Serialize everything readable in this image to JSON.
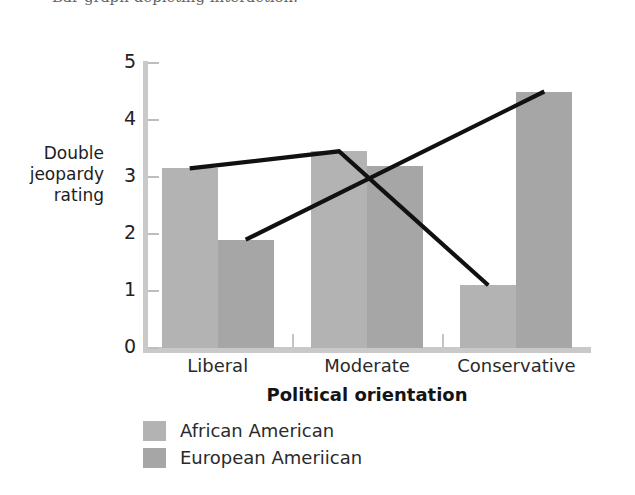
{
  "caption": {
    "text": "Bar graph depicting interaction."
  },
  "chart_data": {
    "type": "bar",
    "title": "",
    "subtitle": "",
    "xlabel": "Political orientation",
    "ylabel": "Double jeopardy rating",
    "ylabel_lines": [
      "Double",
      "jeopardy",
      "rating"
    ],
    "categories": [
      "Liberal",
      "Moderate",
      "Conservative"
    ],
    "series": [
      {
        "name": "African American",
        "color": "#b3b3b3",
        "values": [
          3.15,
          3.45,
          1.1
        ]
      },
      {
        "name": "European Ameriican",
        "color": "#a6a6a6",
        "values": [
          1.9,
          3.2,
          4.5
        ]
      }
    ],
    "overlay_lines": [
      {
        "name": "African American",
        "color": "#111111",
        "values": [
          3.15,
          3.45,
          1.1
        ]
      },
      {
        "name": "European Ameriican",
        "color": "#111111",
        "values": [
          1.9,
          3.2,
          4.5
        ]
      }
    ],
    "ylim": [
      0,
      5
    ],
    "ytick_labels": [
      "0",
      "1",
      "2",
      "3",
      "4",
      "5"
    ],
    "yticks": [
      0,
      1,
      2,
      3,
      4,
      5
    ],
    "grid": false,
    "legend_position": "below-left"
  },
  "legend": {
    "items": [
      {
        "label": "African American",
        "color": "#b3b3b3"
      },
      {
        "label": "European Ameriican",
        "color": "#a6a6a6"
      }
    ]
  }
}
